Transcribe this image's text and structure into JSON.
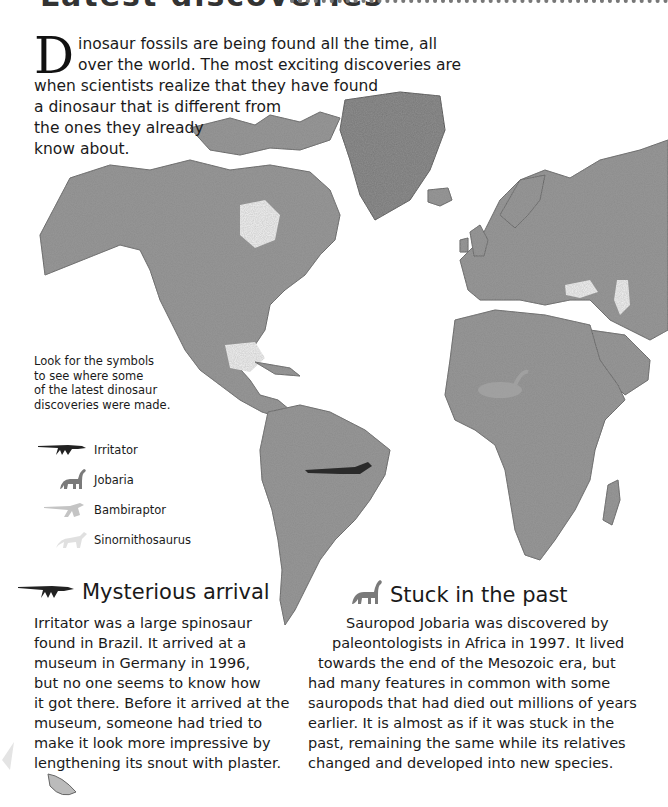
{
  "page": {
    "heading_partial": "Latest discoveries",
    "intro": {
      "drop_cap": "D",
      "lines": [
        "inosaur fossils are being found all the time, all",
        "over the world. The most exciting discoveries are",
        "when scientists realize that they have found",
        "a dinosaur that is different from",
        "the ones they already",
        "know about."
      ]
    },
    "legend": {
      "note_lines": [
        "Look for the symbols",
        "to see where some",
        "of the latest dinosaur",
        "discoveries were made."
      ],
      "items": [
        {
          "label": "Irritator",
          "icon": "irritator-silhouette-icon",
          "color": "#222222"
        },
        {
          "label": "Jobaria",
          "icon": "jobaria-silhouette-icon",
          "color": "#777777"
        },
        {
          "label": "Bambiraptor",
          "icon": "bambiraptor-silhouette-icon",
          "color": "#bbbbbb"
        },
        {
          "label": "Sinornithosaurus",
          "icon": "sinornithosaurus-silhouette-icon",
          "color": "#dddddd"
        }
      ]
    },
    "sections": [
      {
        "title": "Mysterious arrival",
        "icon": "irritator-silhouette-icon",
        "lines": [
          "Irritator was a large spinosaur",
          "found in Brazil. It arrived at a",
          "museum in Germany in 1996,",
          "but no one seems to know how",
          "it got there. Before it arrived at the",
          "museum, someone had tried to",
          "make it look more impressive by",
          "lengthening its snout with plaster."
        ]
      },
      {
        "title": "Stuck in the past",
        "icon": "jobaria-silhouette-icon",
        "lines": [
          "Sauropod Jobaria was discovered by",
          "paleontologists in Africa in 1997. It lived",
          "towards the end of the Mesozoic era, but",
          "had many features in common with some",
          "sauropods that had died out millions of years",
          "earlier. It is almost as if it was stuck in the",
          "past, remaining the same while its relatives",
          "changed and developed into new species."
        ]
      }
    ]
  }
}
